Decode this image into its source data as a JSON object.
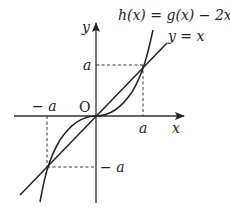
{
  "diagram": {
    "type": "function-graph",
    "curves": [
      {
        "name": "h",
        "label": "h(x) = g(x) − 2x",
        "shape": "cubic-like odd function, flat at origin, intersects y=x at x=±a"
      },
      {
        "name": "line",
        "label": "y = x"
      }
    ],
    "axes": {
      "x_label": "x",
      "y_label": "y",
      "origin_label": "O"
    },
    "ticks": {
      "x_pos": "a",
      "x_neg": "− a",
      "y_pos": "a",
      "y_neg": "− a"
    },
    "intersections": [
      {
        "x": "a",
        "y": "a"
      },
      {
        "x": "0",
        "y": "0"
      },
      {
        "x": "−a",
        "y": "−a"
      }
    ],
    "colors": {
      "stroke": "#222222",
      "dashed": "#333333"
    }
  },
  "labels": {
    "h_eq_prefix": "h",
    "h_eq": "h(x) = g(x) − 2x",
    "line_eq": "y = x",
    "x_axis": "x",
    "y_axis": "y",
    "origin": "O",
    "tick_a_x": "a",
    "tick_neg_a_x": "− a",
    "tick_a_y": "a",
    "tick_neg_a_y": "− a"
  }
}
